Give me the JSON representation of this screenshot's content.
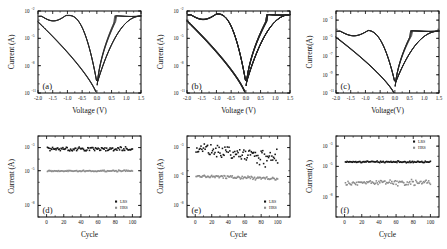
{
  "figure": {
    "panels": [
      "(a)",
      "(b)",
      "(c)",
      "(d)",
      "(e)",
      "(f)"
    ]
  },
  "axis_titles": {
    "voltage_spaced": "Voltage (V)",
    "voltage_tight": "Voltage(V)",
    "current_spaced": "Current (A)",
    "current_tight": "Current(A)",
    "cycle": "Cycle"
  },
  "legend": {
    "lrs": "LRS",
    "hrs": "HRS"
  },
  "colors": {
    "axis": "#0d0d0d",
    "curve": "#232323",
    "lrs_marker": "#151515",
    "hrs_marker": "#8c8c8c",
    "background": "#ffffff"
  },
  "chart_data": [
    {
      "id": "a",
      "type": "line",
      "panel_label": "(a)",
      "title": "",
      "xlabel": "Voltage (V)",
      "ylabel": "Current (A)",
      "xlim": [
        -2.0,
        1.5
      ],
      "xticks": [
        -2.0,
        -1.5,
        -1.0,
        -0.5,
        0.0,
        0.5,
        1.0,
        1.5
      ],
      "xticklabels": [
        "-2.0",
        "-1.5",
        "-1.0",
        "-0.5",
        "0.0",
        "0.5",
        "1.0",
        "1.5"
      ],
      "ylim_exp": [
        -11,
        -2
      ],
      "yticks_exp": [
        -11,
        -8,
        -5,
        -2
      ],
      "yticklabels": [
        "10-11",
        "10-8",
        "10-5",
        "10-2"
      ],
      "ytick_mantissa": "10",
      "ytick_exponents": [
        "-11",
        "-8",
        "-5",
        "-2"
      ],
      "grid": false,
      "legend_position": "none",
      "description": "Bipolar resistive switching I-V hysteresis, 4 overlapping sweeps",
      "sweeps": 4,
      "compliance_exp": -2.55,
      "set_voltage": 0.62,
      "reset_voltage": -1.05
    },
    {
      "id": "b",
      "type": "line",
      "panel_label": "(b)",
      "title": "",
      "xlabel": "Voltage (V)",
      "ylabel": "Current (A)",
      "xlim": [
        -2.0,
        1.5
      ],
      "xticks": [
        -2.0,
        -1.5,
        -1.0,
        -0.5,
        0.0,
        0.5,
        1.0,
        1.5
      ],
      "xticklabels": [
        "-2.0",
        "-1.5",
        "-1.0",
        "-0.5",
        "0.0",
        "0.5",
        "1.0",
        "1.5"
      ],
      "ylim_exp": [
        -11,
        -2
      ],
      "yticks_exp": [
        -11,
        -8,
        -5,
        -2
      ],
      "ytick_mantissa": "10",
      "ytick_exponents": [
        "-11",
        "-8",
        "-5",
        "-2"
      ],
      "grid": false,
      "legend_position": "none",
      "description": "Bipolar resistive switching I-V hysteresis, many overlapping sweeps with broader spread",
      "sweeps": 8,
      "compliance_exp": -2.4,
      "set_voltage": 0.72,
      "reset_voltage": -1.0
    },
    {
      "id": "c",
      "type": "line",
      "panel_label": "(c)",
      "title": "",
      "xlabel": "Voltage(V)",
      "ylabel": "Current(A)",
      "xlim": [
        -2.0,
        1.5
      ],
      "xticks": [
        -2.0,
        -1.5,
        -1.0,
        -0.5,
        0.0,
        0.5,
        1.0,
        1.5
      ],
      "xticklabels": [
        "-2.0",
        "-1.5",
        "-1.0",
        "-0.5",
        "0.0",
        "0.5",
        "1.0",
        "1.5"
      ],
      "ylim_exp": [
        -11,
        -2
      ],
      "yticks_exp": [
        -11,
        -9,
        -7,
        -5,
        -3
      ],
      "ytick_mantissa": "10",
      "ytick_exponents": [
        "-11",
        "-9",
        "-7",
        "-5",
        "-3"
      ],
      "grid": false,
      "legend_position": "none",
      "description": "Bipolar resistive switching I-V hysteresis with hard current compliance plateau",
      "sweeps": 5,
      "compliance_exp": -4.2,
      "set_voltage": 0.55,
      "reset_voltage": -0.9
    },
    {
      "id": "d",
      "type": "scatter",
      "panel_label": "(d)",
      "title": "",
      "xlabel": "Cycle",
      "ylabel": "Current (A)",
      "xlim": [
        -10,
        110
      ],
      "xticks": [
        0,
        20,
        40,
        60,
        80,
        100
      ],
      "xticklabels": [
        "0",
        "20",
        "40",
        "60",
        "80",
        "100"
      ],
      "ylim_exp": [
        -9,
        -2
      ],
      "yticks_exp": [
        -8,
        -5,
        -3
      ],
      "ytick_mantissa": "10",
      "ytick_exponents": [
        "-8",
        "-5",
        "-3"
      ],
      "grid": false,
      "legend_position": "lower-right",
      "description": "Endurance over 100 cycles, both states stable and well separated",
      "series": [
        {
          "name": "LRS",
          "marker": "square",
          "color": "#151515",
          "mean_exp": -3.12,
          "scatter": 0.16,
          "drift": 0.0,
          "n": 100
        },
        {
          "name": "HRS",
          "marker": "square",
          "color": "#8c8c8c",
          "mean_exp": -5.02,
          "scatter": 0.05,
          "drift": 0.0,
          "n": 100
        }
      ]
    },
    {
      "id": "e",
      "type": "scatter",
      "panel_label": "(e)",
      "title": "",
      "xlabel": "Cycle",
      "ylabel": "Current (A)",
      "xlim": [
        -10,
        115
      ],
      "xticks": [
        0,
        20,
        40,
        60,
        80,
        100
      ],
      "xticklabels": [
        "0",
        "20",
        "40",
        "60",
        "80",
        "100"
      ],
      "ylim_exp": [
        -9,
        -2
      ],
      "yticks_exp": [
        -8,
        -5.5,
        -3
      ],
      "ytick_mantissa": "10",
      "ytick_exponents": [
        "-8",
        "-6",
        "-3"
      ],
      "grid": false,
      "legend_position": "lower-right",
      "description": "Endurance over 100 cycles showing LRS degradation and increasing scatter",
      "series": [
        {
          "name": "LRS",
          "marker": "square",
          "color": "#151515",
          "mean_exp": -3.05,
          "scatter": 0.55,
          "drift": -0.95,
          "n": 100
        },
        {
          "name": "HRS",
          "marker": "square",
          "color": "#8c8c8c",
          "mean_exp": -5.45,
          "scatter": 0.11,
          "drift": -0.25,
          "n": 100
        }
      ]
    },
    {
      "id": "f",
      "type": "scatter",
      "panel_label": "(f)",
      "title": "",
      "xlabel": "Cycle",
      "ylabel": "Current(A)",
      "xlim": [
        -10,
        110
      ],
      "xticks": [
        0,
        20,
        40,
        60,
        80,
        100
      ],
      "xticklabels": [
        "0",
        "20",
        "40",
        "60",
        "80",
        "100"
      ],
      "ylim_exp": [
        -10,
        -2
      ],
      "yticks_exp": [
        -3,
        -5,
        -8
      ],
      "ytick_mantissa": "10",
      "ytick_exponents": [
        "-3",
        "-5",
        "-8"
      ],
      "grid": false,
      "legend_position": "upper-right",
      "description": "Endurance over 100 cycles, very tight LRS band and noisier HRS band",
      "series": [
        {
          "name": "LRS",
          "marker": "square",
          "color": "#151515",
          "mean_exp": -4.55,
          "scatter": 0.07,
          "drift": 0.0,
          "n": 100
        },
        {
          "name": "HRS",
          "marker": "square",
          "color": "#8c8c8c",
          "mean_exp": -6.62,
          "scatter": 0.22,
          "drift": 0.0,
          "n": 100
        }
      ]
    }
  ]
}
